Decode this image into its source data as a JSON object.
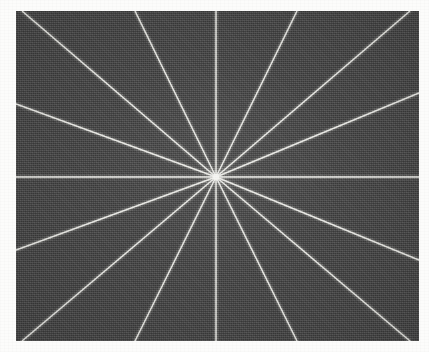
{
  "figure": {
    "plate": {
      "x": 16,
      "y": 11,
      "width": 403,
      "height": 330,
      "background_color": "#4c4c4c",
      "texture": "grainy halftone noise"
    },
    "center": {
      "x": 216,
      "y": 177,
      "label": "center-point"
    },
    "line_color": "#e8e8e4",
    "line_width_px": 1.4,
    "spoke_count": 16,
    "angle_step_degrees": 22.5
  },
  "chart_data": {
    "type": "line",
    "subtitle": "",
    "xlabel": "",
    "ylabel": "",
    "grid": false,
    "legend": "none",
    "xlim": [
      16,
      419
    ],
    "ylim": [
      11,
      341
    ],
    "center": {
      "x": 216,
      "y": 177
    },
    "series": [
      {
        "name": "spoke-000",
        "angle_deg": 0,
        "values": [
          216,
          177,
          419,
          177
        ]
      },
      {
        "name": "spoke-022",
        "angle_deg": 22.5,
        "values": [
          216,
          177,
          419,
          93
        ]
      },
      {
        "name": "spoke-045",
        "angle_deg": 45,
        "values": [
          216,
          177,
          410,
          11
        ]
      },
      {
        "name": "spoke-067",
        "angle_deg": 67.5,
        "values": [
          216,
          177,
          297,
          11
        ]
      },
      {
        "name": "spoke-090",
        "angle_deg": 90,
        "values": [
          216,
          177,
          216,
          11
        ]
      },
      {
        "name": "spoke-112",
        "angle_deg": 112.5,
        "values": [
          216,
          177,
          135,
          11
        ]
      },
      {
        "name": "spoke-135",
        "angle_deg": 135,
        "values": [
          216,
          177,
          22,
          11
        ]
      },
      {
        "name": "spoke-157",
        "angle_deg": 157.5,
        "values": [
          216,
          177,
          16,
          104
        ]
      },
      {
        "name": "spoke-180",
        "angle_deg": 180,
        "values": [
          216,
          177,
          16,
          177
        ]
      },
      {
        "name": "spoke-202",
        "angle_deg": 202.5,
        "values": [
          216,
          177,
          16,
          250
        ]
      },
      {
        "name": "spoke-225",
        "angle_deg": 225,
        "values": [
          216,
          177,
          22,
          341
        ]
      },
      {
        "name": "spoke-247",
        "angle_deg": 247.5,
        "values": [
          216,
          177,
          135,
          341
        ]
      },
      {
        "name": "spoke-270",
        "angle_deg": 270,
        "values": [
          216,
          177,
          216,
          341
        ]
      },
      {
        "name": "spoke-292",
        "angle_deg": 292.5,
        "values": [
          216,
          177,
          297,
          341
        ]
      },
      {
        "name": "spoke-315",
        "angle_deg": 315,
        "values": [
          216,
          177,
          410,
          341
        ]
      },
      {
        "name": "spoke-337",
        "angle_deg": 337.5,
        "values": [
          216,
          177,
          419,
          260
        ]
      }
    ]
  }
}
